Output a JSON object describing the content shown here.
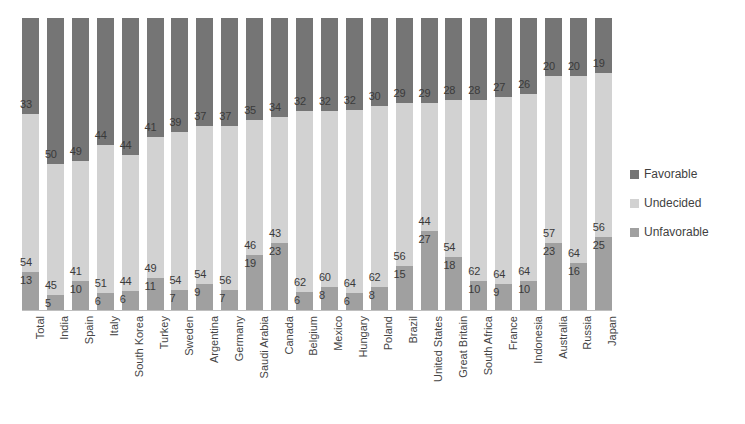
{
  "chart_data": {
    "type": "bar",
    "subtype": "stacked-bar-100",
    "title": "",
    "xlabel": "",
    "ylabel": "",
    "ylim": [
      0,
      100
    ],
    "grid": false,
    "legend_position": "right",
    "stacking_order_top_to_bottom": [
      "Favorable",
      "Undecided",
      "Unfavorable"
    ],
    "categories": [
      "Total",
      "India",
      "Spain",
      "Italy",
      "South Korea",
      "Turkey",
      "Sweden",
      "Argentina",
      "Germany",
      "Saudi Arabia",
      "Canada",
      "Belgium",
      "Mexico",
      "Hungary",
      "Poland",
      "Brazil",
      "United States",
      "Great Britain",
      "South Africa",
      "France",
      "Indonesia",
      "Australia",
      "Russia",
      "Japan"
    ],
    "series": [
      {
        "name": "Favorable",
        "color": "#757575",
        "values": [
          33,
          50,
          49,
          44,
          44,
          41,
          39,
          37,
          37,
          35,
          34,
          32,
          32,
          32,
          30,
          29,
          29,
          28,
          28,
          27,
          26,
          20,
          20,
          19
        ]
      },
      {
        "name": "Undecided",
        "color": "#d2d2d2",
        "values": [
          54,
          45,
          41,
          51,
          44,
          49,
          54,
          54,
          56,
          46,
          43,
          62,
          60,
          64,
          62,
          56,
          44,
          54,
          62,
          64,
          64,
          57,
          64,
          56
        ]
      },
      {
        "name": "Unfavorable",
        "color": "#a0a0a0",
        "values": [
          13,
          5,
          10,
          6,
          6,
          11,
          7,
          9,
          7,
          19,
          23,
          6,
          8,
          6,
          8,
          15,
          27,
          18,
          10,
          9,
          10,
          23,
          16,
          25
        ]
      }
    ]
  },
  "legend": {
    "items": [
      {
        "label": "Favorable",
        "color": "#757575"
      },
      {
        "label": "Undecided",
        "color": "#d2d2d2"
      },
      {
        "label": "Unfavorable",
        "color": "#a0a0a0"
      }
    ]
  }
}
